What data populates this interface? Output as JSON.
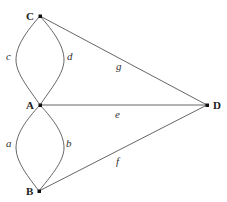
{
  "diagram": {
    "type": "multigraph",
    "nodes": [
      {
        "id": "C",
        "label": "C",
        "x": 40,
        "y": 16
      },
      {
        "id": "A",
        "label": "A",
        "x": 40,
        "y": 105
      },
      {
        "id": "B",
        "label": "B",
        "x": 39,
        "y": 191
      },
      {
        "id": "D",
        "label": "D",
        "x": 207,
        "y": 105
      }
    ],
    "edges": [
      {
        "id": "a",
        "label": "a",
        "from": "A",
        "to": "B",
        "shape": "curve-left"
      },
      {
        "id": "b",
        "label": "b",
        "from": "A",
        "to": "B",
        "shape": "curve-right"
      },
      {
        "id": "c",
        "label": "c",
        "from": "C",
        "to": "A",
        "shape": "curve-left"
      },
      {
        "id": "d",
        "label": "d",
        "from": "C",
        "to": "A",
        "shape": "curve-right"
      },
      {
        "id": "e",
        "label": "e",
        "from": "A",
        "to": "D",
        "shape": "straight"
      },
      {
        "id": "f",
        "label": "f",
        "from": "B",
        "to": "D",
        "shape": "straight"
      },
      {
        "id": "g",
        "label": "g",
        "from": "C",
        "to": "D",
        "shape": "straight"
      }
    ]
  },
  "labels": {
    "node_c": "C",
    "node_a": "A",
    "node_b": "B",
    "node_d": "D",
    "edge_a": "a",
    "edge_b": "b",
    "edge_c": "c",
    "edge_d": "d",
    "edge_e": "e",
    "edge_f": "f",
    "edge_g": "g"
  },
  "colors": {
    "edge": "#555555",
    "node": "#111111",
    "background": "#ffffff"
  }
}
